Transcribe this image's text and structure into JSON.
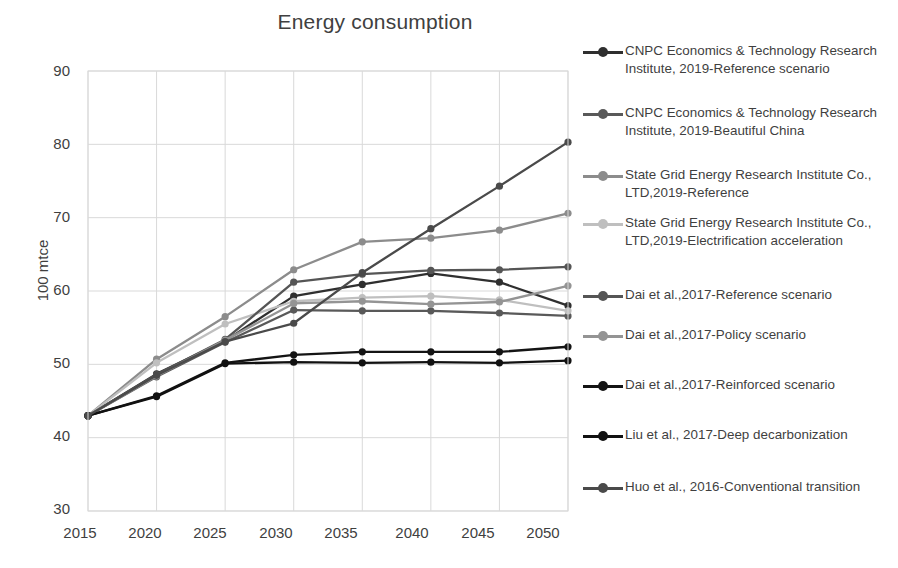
{
  "chart": {
    "title": "Energy consumption",
    "ylabel": "100 mtce"
  },
  "axes": {
    "y_ticks": [
      "90",
      "80",
      "70",
      "60",
      "50",
      "40",
      "30"
    ],
    "x_ticks": [
      "2015",
      "2020",
      "2025",
      "2030",
      "2035",
      "2040",
      "2045",
      "2050"
    ]
  },
  "legend": {
    "items": [
      {
        "label": "CNPC Economics & Technology Research Institute, 2019-Reference scenario",
        "color": "#2f2f2f"
      },
      {
        "label": "CNPC Economics & Technology Research Institute, 2019-Beautiful China",
        "color": "#595959"
      },
      {
        "label": "State Grid Energy Research Institute Co., LTD,2019-Reference",
        "color": "#8c8c8c"
      },
      {
        "label": "State Grid Energy Research Institute Co., LTD,2019-Electrification acceleration",
        "color": "#bfbfbf"
      },
      {
        "label": "Dai et al.,2017-Reference scenario",
        "color": "#555555"
      },
      {
        "label": "Dai et al.,2017-Policy scenario",
        "color": "#949494"
      },
      {
        "label": "Dai et al.,2017-Reinforced scenario",
        "color": "#141414"
      },
      {
        "label": "Liu et al., 2017-Deep decarbonization",
        "color": "#111111"
      },
      {
        "label": "Huo et al., 2016-Conventional transition",
        "color": "#4a4a4a"
      }
    ]
  },
  "chart_data": {
    "type": "line",
    "title": "Energy consumption",
    "xlabel": "",
    "ylabel": "100 mtce",
    "xlim": [
      2015,
      2050
    ],
    "ylim": [
      30,
      90
    ],
    "grid": true,
    "legend_position": "right",
    "x": [
      2015,
      2020,
      2025,
      2030,
      2035,
      2040,
      2045,
      2050
    ],
    "series": [
      {
        "name": "CNPC Economics & Technology Research Institute, 2019-Reference scenario",
        "color": "#2f2f2f",
        "values": [
          43.0,
          48.7,
          53.2,
          59.3,
          60.9,
          62.4,
          61.2,
          58.0
        ]
      },
      {
        "name": "CNPC Economics & Technology Research Institute, 2019-Beautiful China",
        "color": "#595959",
        "values": [
          43.0,
          48.3,
          53.0,
          57.4,
          57.3,
          57.3,
          57.0,
          56.6
        ]
      },
      {
        "name": "State Grid Energy Research Institute Co., LTD,2019-Reference",
        "color": "#8c8c8c",
        "values": [
          43.0,
          50.7,
          56.5,
          62.9,
          66.7,
          67.2,
          68.3,
          70.6
        ]
      },
      {
        "name": "State Grid Energy Research Institute Co., LTD,2019-Electrification acceleration",
        "color": "#bfbfbf",
        "values": [
          43.0,
          50.2,
          55.5,
          58.6,
          59.1,
          59.3,
          58.8,
          57.3
        ]
      },
      {
        "name": "Dai et al.,2017-Reference scenario",
        "color": "#555555",
        "values": [
          43.0,
          48.6,
          53.4,
          61.2,
          62.3,
          62.8,
          62.9,
          63.3
        ]
      },
      {
        "name": "Dai et al.,2017-Policy scenario",
        "color": "#949494",
        "values": [
          43.0,
          48.4,
          53.3,
          58.3,
          58.6,
          58.2,
          58.5,
          60.7
        ]
      },
      {
        "name": "Dai et al.,2017-Reinforced scenario",
        "color": "#141414",
        "values": [
          43.0,
          45.7,
          50.2,
          51.3,
          51.7,
          51.7,
          51.7,
          52.4
        ]
      },
      {
        "name": "Liu et al., 2017-Deep decarbonization",
        "color": "#111111",
        "values": [
          43.0,
          45.6,
          50.1,
          50.3,
          50.2,
          50.3,
          50.2,
          50.5
        ]
      },
      {
        "name": "Huo et al., 2016-Conventional transition",
        "color": "#4a4a4a",
        "values": [
          43.0,
          48.5,
          53.1,
          55.6,
          62.5,
          68.5,
          74.3,
          80.3
        ]
      }
    ]
  }
}
